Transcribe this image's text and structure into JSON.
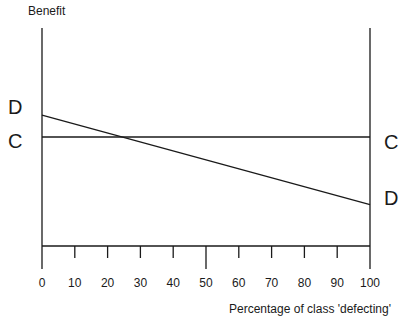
{
  "labels": {
    "d_left": "D",
    "c_left": "C",
    "c_right": "C",
    "d_right": "D"
  },
  "colors": {
    "line": "#1a1a1a",
    "background": "#ffffff"
  },
  "chart_data": {
    "type": "line",
    "title": "",
    "xlabel": "Percentage of class 'defecting'",
    "ylabel": "Benefit",
    "xlim": [
      0,
      100
    ],
    "ylim": [
      0,
      1
    ],
    "x_ticks": [
      0,
      10,
      20,
      30,
      40,
      50,
      60,
      70,
      80,
      90,
      100
    ],
    "major_x_ticks": [
      0,
      50,
      100
    ],
    "y_ticks_labeled": false,
    "grid": false,
    "legend_position": "curve-ends",
    "series": [
      {
        "name": "C",
        "description": "constant benefit line labeled C at both ends",
        "x": [
          0,
          100
        ],
        "values": [
          0.5,
          0.5
        ]
      },
      {
        "name": "D",
        "description": "downward sloping benefit line labeled D at both ends",
        "x": [
          0,
          100
        ],
        "values": [
          0.6,
          0.19
        ]
      }
    ]
  }
}
